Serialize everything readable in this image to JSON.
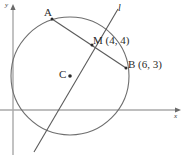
{
  "figure": {
    "kind": "geometry-diagram",
    "colors": {
      "axis": "#a8a8a8",
      "circle": "#6e6e6e",
      "line": "#5a5a5a",
      "chord": "#5a5a5a",
      "text": "#2b2b2b",
      "background": "#ffffff"
    },
    "axes": {
      "x_label": "x",
      "y_label": "y",
      "origin_px": [
        13,
        110
      ]
    },
    "circle": {
      "center_label": "C",
      "center_px": [
        70,
        76
      ],
      "radius_px": 59
    },
    "line": {
      "label": "l"
    },
    "points": [
      {
        "name": "A",
        "label": "A",
        "coords_label": "",
        "px": [
          52,
          19
        ]
      },
      {
        "name": "M",
        "label": "M",
        "coords_label": "M (4, 4)",
        "px": [
          92,
          45
        ]
      },
      {
        "name": "B",
        "label": "B",
        "coords_label": "B (6, 3)",
        "px": [
          125,
          67
        ]
      },
      {
        "name": "C",
        "label": "C",
        "coords_label": "C",
        "px": [
          70,
          76
        ]
      }
    ],
    "labels": {
      "a": "A",
      "c": "C",
      "m_with_coords": "M (4, 4)",
      "b_with_coords": "B (6, 3)",
      "line_l": "l",
      "axis_x": "x",
      "axis_y": "y"
    }
  }
}
